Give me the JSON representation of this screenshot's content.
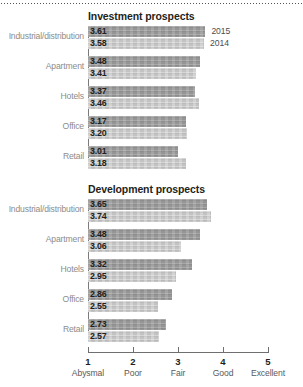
{
  "chart_data": [
    {
      "type": "bar",
      "title": "Investment prospects",
      "orientation": "horizontal",
      "categories": [
        "Industrial/distribution",
        "Apartment",
        "Hotels",
        "Office",
        "Retail"
      ],
      "series": [
        {
          "name": "2015",
          "values": [
            3.61,
            3.48,
            3.37,
            3.17,
            3.01
          ]
        },
        {
          "name": "2014",
          "values": [
            3.58,
            3.41,
            3.46,
            3.2,
            3.18
          ]
        }
      ],
      "xlabel": "",
      "ylabel": "",
      "xlim": [
        1,
        5
      ],
      "grid": false,
      "legend_position": "right-of-first-group"
    },
    {
      "type": "bar",
      "title": "Development prospects",
      "orientation": "horizontal",
      "categories": [
        "Industrial/distribution",
        "Apartment",
        "Hotels",
        "Office",
        "Retail"
      ],
      "series": [
        {
          "name": "2015",
          "values": [
            3.65,
            3.48,
            3.32,
            2.86,
            2.73
          ]
        },
        {
          "name": "2014",
          "values": [
            3.74,
            3.06,
            2.95,
            2.55,
            2.57
          ]
        }
      ],
      "xlabel": "",
      "ylabel": "",
      "xlim": [
        1,
        5
      ],
      "grid": false,
      "legend_position": "none"
    }
  ],
  "axis": {
    "ticks": [
      {
        "number": "1",
        "word": "Abysmal",
        "value": 1
      },
      {
        "number": "2",
        "word": "Poor",
        "value": 2
      },
      {
        "number": "3",
        "word": "Fair",
        "value": 3
      },
      {
        "number": "4",
        "word": "Good",
        "value": 4
      },
      {
        "number": "5",
        "word": "Excellent",
        "value": 5
      }
    ]
  },
  "legend": {
    "entries": [
      {
        "label": "2015",
        "color": "#9b9b9b"
      },
      {
        "label": "2014",
        "color": "#c9c9c9"
      }
    ]
  },
  "colors": {
    "bar_2015": "#9b9b9b",
    "bar_2014": "#c9c9c9",
    "axis": "#6f6f6f",
    "category_label": "#8c8c8c",
    "value_label": "#231f20",
    "background": "#ffffff"
  }
}
